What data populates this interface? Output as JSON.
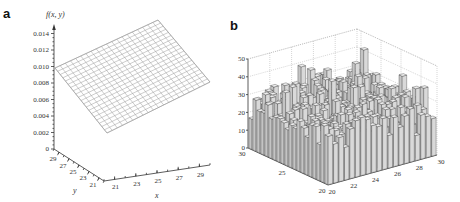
{
  "figure": {
    "panels": [
      {
        "label": "a"
      },
      {
        "label": "b"
      }
    ]
  },
  "chart_data": [
    {
      "type": "surface",
      "panel": "a",
      "title": "",
      "zlabel": "f(x, y)",
      "xlabel": "x",
      "ylabel": "y",
      "z_ticks": [
        "0",
        "0.002",
        "0.004",
        "0.006",
        "0.008",
        "0.010",
        "0.012",
        "0.014"
      ],
      "x_ticks": [
        "21",
        "23",
        "25",
        "27",
        "29"
      ],
      "y_ticks": [
        "29",
        "27",
        "25",
        "23",
        "21"
      ],
      "zlim": [
        0,
        0.014
      ],
      "xlim": [
        20,
        30
      ],
      "ylim": [
        20,
        30
      ],
      "description": "Planar wireframe mesh, approx. 0.010 at near-left corner rising to ~0.014 at far corner; value range roughly 0.002–0.014",
      "corner_values": {
        "x20_y30": 0.01,
        "x30_y30": 0.014,
        "x30_y20": 0.008,
        "x20_y20": 0.002
      },
      "grid": true
    },
    {
      "type": "bar3d",
      "panel": "b",
      "title": "",
      "zlabel": "",
      "xlabel": "",
      "ylabel": "",
      "z_ticks": [
        "0",
        "10",
        "20",
        "30",
        "40",
        "50"
      ],
      "x_ticks": [
        "20",
        "22",
        "24",
        "26",
        "28",
        "30"
      ],
      "y_ticks": [
        "20",
        "25",
        "30"
      ],
      "zlim": [
        0,
        50
      ],
      "xlim": [
        20,
        30
      ],
      "ylim": [
        20,
        30
      ],
      "description": "3D histogram of counts on a ~20x20 grid over x,y in [20,30]; bar heights vary roughly 10–45",
      "grid": true
    }
  ]
}
